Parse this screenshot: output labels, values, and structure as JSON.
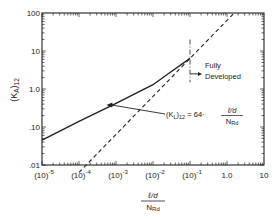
{
  "chart_data": {
    "type": "line",
    "title": "",
    "xlabel": "l/d ÷ N_Rd",
    "xlabel_num": "ℓ/d",
    "xlabel_den": "N",
    "xlabel_den_sub": "Rd",
    "ylabel": "(K_A)_12",
    "ylabel_main": "(K",
    "ylabel_sub1": "A",
    "ylabel_close": ")",
    "ylabel_sub2": "12",
    "x_scale": "log",
    "y_scale": "log",
    "xlim": [
      1e-05,
      10
    ],
    "ylim": [
      0.01,
      100
    ],
    "x_ticks": [
      {
        "value": 1e-05,
        "base": "(10)",
        "exp": "-5"
      },
      {
        "value": 0.0001,
        "base": "(10)",
        "exp": "-4"
      },
      {
        "value": 0.001,
        "base": "(10)",
        "exp": "-3"
      },
      {
        "value": 0.01,
        "base": "(10)",
        "exp": "-2"
      },
      {
        "value": 0.1,
        "base": "(10)",
        "exp": "-1"
      },
      {
        "value": 1,
        "base": "1.0",
        "exp": ""
      },
      {
        "value": 10,
        "base": "10",
        "exp": ""
      }
    ],
    "y_ticks": [
      {
        "value": 0.01,
        "label": ".01"
      },
      {
        "value": 0.1,
        "label": ".10"
      },
      {
        "value": 1,
        "label": "1.0"
      },
      {
        "value": 10,
        "label": "10"
      },
      {
        "value": 100,
        "label": "100"
      }
    ],
    "grid": false,
    "series": [
      {
        "name": "(K_A)_12 developing flow",
        "style": "solid",
        "x": [
          1e-05,
          0.0001,
          0.001,
          0.01,
          0.03,
          0.1
        ],
        "y": [
          0.045,
          0.14,
          0.42,
          1.3,
          2.8,
          6.4
        ]
      },
      {
        "name": "(K_L)_12 = 64 · (l/d)/N_Rd",
        "style": "dashed",
        "x": [
          0.0001,
          0.001,
          0.01,
          0.1,
          1.0,
          1.5625
        ],
        "y": [
          0.0064,
          0.064,
          0.64,
          6.4,
          64,
          100
        ]
      }
    ],
    "annotations": [
      {
        "type": "vline",
        "style": "dash-dot",
        "x": 0.1,
        "y_range": [
          1.5,
          20
        ]
      },
      {
        "type": "label",
        "text_line1": "Fully",
        "text_line2": "Developed",
        "arrow_from_x": 0.1,
        "arrow_y": 2.5
      },
      {
        "type": "equation",
        "lhs_main": "(K",
        "lhs_sub1": "L",
        "lhs_close": ")",
        "lhs_sub2": "12",
        "eq": "= 64·",
        "frac_num": "ℓ/d",
        "frac_den": "N",
        "frac_den_sub": "Rd",
        "arrow_to_x": 0.00055,
        "arrow_to_y": 0.38
      }
    ]
  }
}
